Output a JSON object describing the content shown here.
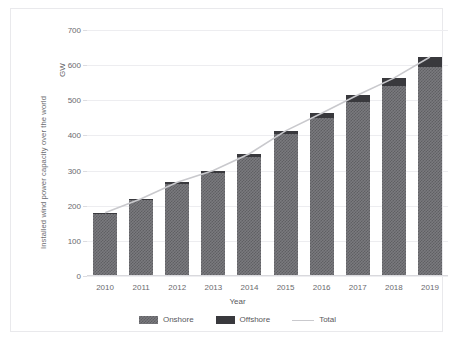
{
  "chart_data": {
    "type": "bar",
    "stacked": true,
    "title": "",
    "xlabel": "Year",
    "ylabel": "Installed wind power capacity over the world",
    "yunit": "GW",
    "categories": [
      "2010",
      "2011",
      "2012",
      "2013",
      "2014",
      "2015",
      "2016",
      "2017",
      "2018",
      "2019"
    ],
    "yticks": [
      0,
      100,
      200,
      300,
      400,
      500,
      600,
      700
    ],
    "ylim": [
      0,
      700
    ],
    "grid": true,
    "legend_position": "bottom",
    "series": [
      {
        "name": "Onshore",
        "color": "#7a7a7e",
        "values": [
          177,
          215,
          261,
          293,
          340,
          404,
          449,
          496,
          540,
          594
        ]
      },
      {
        "name": "Offshore",
        "color": "#39393d",
        "values": [
          3,
          5,
          6,
          7,
          8,
          9,
          14,
          19,
          23,
          29
        ]
      },
      {
        "name": "Total",
        "color": "#c9c9cd",
        "type": "line",
        "values": [
          180,
          220,
          267,
          300,
          348,
          413,
          463,
          515,
          563,
          623
        ]
      }
    ]
  },
  "legend": {
    "items": [
      {
        "label": "Onshore"
      },
      {
        "label": "Offshore"
      },
      {
        "label": "Total"
      }
    ]
  }
}
